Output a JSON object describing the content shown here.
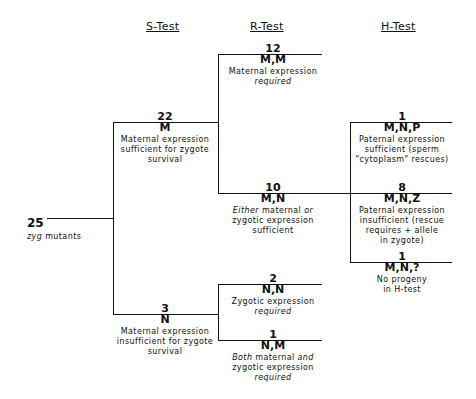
{
  "headers": {
    "s_test": "S-Test",
    "r_test": "R-Test",
    "h_test": "H-Test"
  },
  "root": {
    "count": "25",
    "label_italic": "zyg",
    "label_rest": " mutants"
  },
  "s_test": [
    {
      "count": "22",
      "code": "M",
      "lines": [
        "Maternal expression",
        "sufficient for zygote",
        "survival"
      ]
    },
    {
      "count": "3",
      "code": "N",
      "lines": [
        "Maternal expression",
        "insufficient for zygote",
        "survival"
      ]
    }
  ],
  "r_test": [
    {
      "count": "12",
      "code": "M,M",
      "line1": "Maternal expression",
      "line2_italic": "required"
    },
    {
      "count": "10",
      "code": "M,N",
      "line1_italic_a": "Either",
      "line1_mid": " maternal ",
      "line1_italic_b": "or",
      "line2": "zygotic expression",
      "line3": "sufficient"
    },
    {
      "count": "2",
      "code": "N,N",
      "line1": "Zygotic expression",
      "line2_italic": "required"
    },
    {
      "count": "1",
      "code": "N,M",
      "line1_italic_a": "Both",
      "line1_mid": " maternal ",
      "line1_italic_b": "and",
      "line2": "zygotic expression",
      "line3_italic": "required"
    }
  ],
  "h_test": [
    {
      "count": "1",
      "code": "M,N,P",
      "lines": [
        "Paternal expression",
        "sufficient (sperm",
        "\"cytoplasm\" rescues)"
      ]
    },
    {
      "count": "8",
      "code": "M,N,Z",
      "lines": [
        "Paternal expression",
        "insufficient (rescue",
        "requires + allele",
        "in zygote)"
      ]
    },
    {
      "count": "1",
      "code": "M,N,?",
      "lines": [
        "No progeny",
        "in H-test"
      ]
    }
  ]
}
